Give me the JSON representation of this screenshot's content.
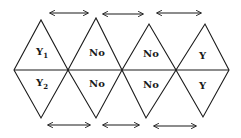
{
  "diagram": {
    "colors": {
      "stroke": "#1a1a1a",
      "background": "#ffffff"
    },
    "top_row": [
      {
        "label": "Y",
        "subscript": "1"
      },
      {
        "label": "No",
        "subscript": ""
      },
      {
        "label": "No",
        "subscript": ""
      },
      {
        "label": "Y",
        "subscript": ""
      }
    ],
    "bottom_row": [
      {
        "label": "Y",
        "subscript": "2"
      },
      {
        "label": "No",
        "subscript": ""
      },
      {
        "label": "No",
        "subscript": ""
      },
      {
        "label": "Y",
        "subscript": ""
      }
    ],
    "top_arrows": [
      {
        "type": "double-headed",
        "from_x": 50,
        "to_x": 88
      },
      {
        "type": "double-headed",
        "from_x": 103,
        "to_x": 143
      },
      {
        "type": "double-headed",
        "from_x": 157,
        "to_x": 201
      }
    ],
    "bottom_arrows": [
      {
        "type": "double-headed",
        "from_x": 48,
        "to_x": 90
      },
      {
        "type": "double-headed",
        "from_x": 103,
        "to_x": 139
      },
      {
        "type": "double-headed",
        "from_x": 154,
        "to_x": 196
      }
    ]
  }
}
